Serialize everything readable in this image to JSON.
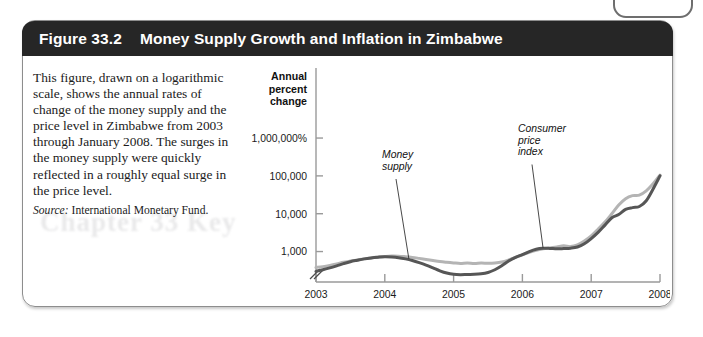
{
  "figure": {
    "number": "Figure 33.2",
    "title": "Money Supply Growth and Inflation in Zimbabwe",
    "caption": "This figure, drawn on a logarithmic scale, shows the annual rates of change of the money supply and the price level in Zimbabwe from 2003 through January 2008. The surges in the money supply were quickly reflected in a roughly equal surge in the price level.",
    "source_label": "Source:",
    "source_text": " International Monetary Fund.",
    "bleed_text": "Chapter 33  Key"
  },
  "colors": {
    "title_bar": "#262626",
    "border": "#8d8d8d",
    "money_supply_line": "#b4b4b4",
    "cpi_line": "#565656",
    "axis": "#9a9a9a",
    "text": "#1b1b1b"
  },
  "chart_data": {
    "type": "line",
    "title": "Money Supply Growth and Inflation in Zimbabwe",
    "xlabel": "Year",
    "ylabel": "Annual percent change",
    "ylabel_lines": [
      "Annual",
      "percent",
      "change"
    ],
    "yscale": "log",
    "grid": false,
    "legend": "annotations",
    "axis_break": true,
    "ytick_labels": [
      "1,000,000%",
      "100,000",
      "10,000",
      "1,000"
    ],
    "ytick_values": [
      1000000,
      100000,
      10000,
      1000
    ],
    "xtick_labels": [
      "2003",
      "2004",
      "2005",
      "2006",
      "2007",
      "2008"
    ],
    "xtick_values": [
      2003,
      2004,
      2005,
      2006,
      2007,
      2008
    ],
    "xlim": [
      2003,
      2008
    ],
    "ylim": [
      200,
      3000000
    ],
    "annotations": [
      {
        "name": "money-supply",
        "lines": [
          "Money",
          "supply"
        ],
        "target_x": 2004.35,
        "target_y": 640
      },
      {
        "name": "consumer-price-index",
        "lines": [
          "Consumer",
          "price",
          "index"
        ],
        "target_x": 2006.3,
        "target_y": 1250
      }
    ],
    "series": [
      {
        "name": "Money supply",
        "color": "#b4b4b4",
        "x": [
          2003.0,
          2003.1,
          2003.2,
          2003.3,
          2003.4,
          2003.5,
          2003.6,
          2003.7,
          2003.8,
          2003.9,
          2004.0,
          2004.1,
          2004.2,
          2004.3,
          2004.4,
          2004.5,
          2004.6,
          2004.7,
          2004.8,
          2004.9,
          2005.0,
          2005.1,
          2005.2,
          2005.3,
          2005.4,
          2005.5,
          2005.6,
          2005.7,
          2005.8,
          2005.9,
          2006.0,
          2006.1,
          2006.2,
          2006.3,
          2006.4,
          2006.5,
          2006.6,
          2006.7,
          2006.8,
          2006.9,
          2007.0,
          2007.1,
          2007.2,
          2007.3,
          2007.4,
          2007.5,
          2007.6,
          2007.7,
          2007.8,
          2007.9,
          2008.0
        ],
        "y": [
          380,
          400,
          430,
          470,
          520,
          560,
          600,
          640,
          680,
          710,
          740,
          760,
          755,
          730,
          700,
          660,
          620,
          580,
          545,
          520,
          500,
          485,
          500,
          480,
          495,
          490,
          500,
          530,
          600,
          700,
          820,
          950,
          1080,
          1180,
          1250,
          1320,
          1420,
          1350,
          1500,
          1900,
          2600,
          3900,
          6000,
          10000,
          17000,
          25000,
          30000,
          31000,
          40000,
          62000,
          105000
        ]
      },
      {
        "name": "Consumer price index",
        "color": "#565656",
        "x": [
          2003.0,
          2003.1,
          2003.2,
          2003.3,
          2003.4,
          2003.5,
          2003.6,
          2003.7,
          2003.8,
          2003.9,
          2004.0,
          2004.1,
          2004.2,
          2004.3,
          2004.4,
          2004.5,
          2004.6,
          2004.7,
          2004.8,
          2004.9,
          2005.0,
          2005.1,
          2005.2,
          2005.3,
          2005.4,
          2005.5,
          2005.6,
          2005.7,
          2005.8,
          2005.9,
          2006.0,
          2006.1,
          2006.2,
          2006.3,
          2006.4,
          2006.5,
          2006.6,
          2006.7,
          2006.8,
          2006.9,
          2007.0,
          2007.1,
          2007.2,
          2007.3,
          2007.4,
          2007.5,
          2007.6,
          2007.7,
          2007.8,
          2007.9,
          2008.0
        ],
        "y": [
          300,
          330,
          370,
          420,
          480,
          540,
          590,
          640,
          680,
          710,
          730,
          720,
          690,
          640,
          580,
          510,
          440,
          370,
          310,
          270,
          250,
          245,
          248,
          250,
          258,
          280,
          330,
          420,
          560,
          700,
          830,
          1000,
          1150,
          1220,
          1210,
          1180,
          1200,
          1230,
          1320,
          1600,
          2200,
          3200,
          5000,
          7800,
          9500,
          13000,
          14500,
          15500,
          22000,
          45000,
          100000
        ]
      }
    ]
  }
}
